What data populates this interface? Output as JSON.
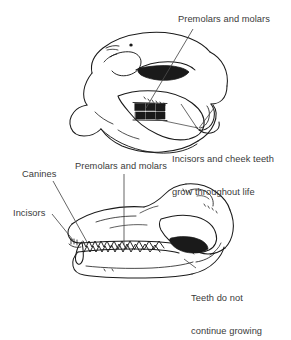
{
  "figure": {
    "background_color": "#ffffff",
    "ink_color": "#1a1a1a",
    "text_color": "#3a3a3a"
  },
  "annotations": {
    "top_premolars": {
      "label": "Premolars and molars",
      "target": "cheek teeth of upper (rodent) skull"
    },
    "top_growth_note": {
      "line1": "Incisors and cheek teeth",
      "line2": "grow throughout life"
    },
    "bottom_canines": {
      "label": "Canines"
    },
    "bottom_premolars": {
      "label": "Premolars and molars"
    },
    "bottom_incisors": {
      "label": "Incisors"
    },
    "bottom_growth_note": {
      "line1": "Teeth do not",
      "line2": "continue growing"
    }
  },
  "skulls": [
    {
      "name": "rodent-skull",
      "position": "top",
      "description": "Rodent skull in left-facing lateral view with large orbit, long diastema and ever-growing incisors"
    },
    {
      "name": "carnivore-skull",
      "position": "bottom",
      "description": "Carnivore (dog-like) skull in right-facing lateral view with incisors, canines, premolars and molars"
    }
  ]
}
